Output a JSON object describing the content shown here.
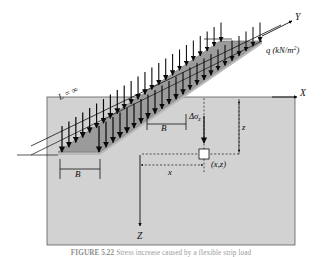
{
  "figure": {
    "axes": {
      "x_label": "X",
      "y_label": "Y",
      "z_label": "Z"
    },
    "labels": {
      "load": "q (kN/m",
      "load_exponent": "2",
      "load_close": ")",
      "length_infinite": "L = ∞",
      "width_top": "B",
      "width_bottom": "B",
      "stress_increase": "Δσ",
      "stress_subscript": "z",
      "depth": "z",
      "offset": "x",
      "point": "(x,z)"
    },
    "colors": {
      "soil_block": "#d2d2d2",
      "soil_block_edge": "#5a5a5a",
      "strip_top": "#9b9b9b",
      "strip_side": "#b4b4b4",
      "line": "#111111",
      "arrow": "#0a0a0a",
      "dashed": "#1a1a1a",
      "background": "#ffffff"
    },
    "geometry": {
      "arrow_count": 24,
      "soil_block": {
        "x": 47,
        "y": 97,
        "w": 248,
        "h": 148
      }
    }
  },
  "caption": {
    "figure_number": "FIGURE 5.22",
    "text": "Stress increase caused by a flexible strip load"
  }
}
